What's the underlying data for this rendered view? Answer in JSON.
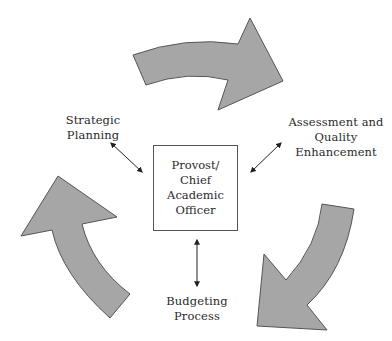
{
  "diagram": {
    "center": {
      "lines": [
        "Provost/",
        "Chief",
        "Academic",
        "Officer"
      ]
    },
    "nodes": {
      "strategic_planning": "Strategic Planning",
      "assessment": [
        "Assessment and",
        "Quality",
        "Enhancement"
      ],
      "budgeting": [
        "Budgeting",
        "Process"
      ]
    },
    "cycle_arrows": [
      {
        "name": "top",
        "direction": "clockwise-right"
      },
      {
        "name": "right",
        "direction": "clockwise-down"
      },
      {
        "name": "left",
        "direction": "clockwise-up"
      }
    ],
    "colors": {
      "arrow_fill": "#a6a6a6",
      "arrow_stroke": "#555555",
      "connector": "#222222"
    }
  }
}
